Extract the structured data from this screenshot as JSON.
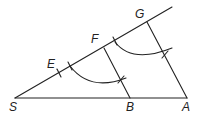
{
  "diagram": {
    "title": "",
    "points": {
      "S": {
        "label": "S",
        "x": 15,
        "y": 98
      },
      "A": {
        "label": "A",
        "x": 187,
        "y": 98
      },
      "B": {
        "label": "B",
        "x": 130,
        "y": 98
      },
      "E": {
        "label": "E",
        "x": 59,
        "y": 73
      },
      "F": {
        "label": "F",
        "x": 104,
        "y": 48
      },
      "G": {
        "label": "G",
        "x": 147,
        "y": 22
      }
    },
    "segments": [
      {
        "from": "S",
        "to": "A",
        "desc": "base line SA"
      },
      {
        "from": "S",
        "to": "ray-end",
        "desc": "ray from S through E, F, G"
      },
      {
        "from": "G",
        "to": "A",
        "desc": "segment GA"
      },
      {
        "from": "F",
        "to": "B",
        "desc": "segment FB parallel to GA"
      }
    ],
    "arcs": [
      {
        "desc": "construction arc through lower intersection near FB"
      },
      {
        "desc": "construction arc through upper intersection near GA"
      }
    ],
    "stroke_color": "#222222"
  }
}
